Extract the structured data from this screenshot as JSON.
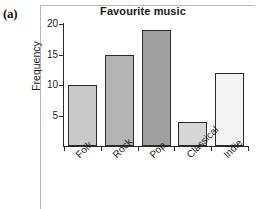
{
  "figure": {
    "label": "(a)"
  },
  "chart_data": {
    "type": "bar",
    "title": "Favourite music",
    "xlabel": "",
    "ylabel": "Frequency",
    "categories": [
      "Folk",
      "Rock",
      "Pop",
      "Classical",
      "Indie"
    ],
    "values": [
      10,
      15,
      19,
      4,
      12
    ],
    "bar_colors": [
      "#c9c9c9",
      "#b4b4b4",
      "#a0a0a0",
      "#d6d6d6",
      "#f4f4f4"
    ],
    "bar_edge_color": "#2b2b2b",
    "ylim": [
      0,
      20
    ],
    "yticks": [
      5,
      10,
      15,
      20
    ],
    "ytick_labels": [
      "5",
      "10",
      "15",
      "20"
    ],
    "grid": false,
    "legend": "none",
    "axis_color": "#2b2b2b",
    "frame_color": "#b9b9b9",
    "background": "#ffffff"
  }
}
